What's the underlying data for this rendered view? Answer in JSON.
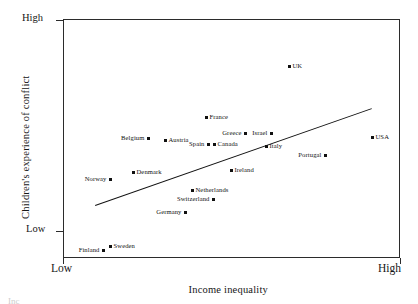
{
  "figure": {
    "background": "#ffffff",
    "ink": "#111111",
    "frame": {
      "left": 63,
      "top": 19,
      "width": 337,
      "height": 239
    }
  },
  "axes": {
    "y": {
      "title": "Children's experience of conflict",
      "high_label": "High",
      "low_label": "Low",
      "high_y": 20,
      "low_y": 231
    },
    "x": {
      "title": "Income inequality",
      "low_label": "Low",
      "high_label": "High"
    }
  },
  "trendline": {
    "x1": 95,
    "y1": 205,
    "x2": 372,
    "y2": 108,
    "color": "#111111"
  },
  "chart_data": {
    "type": "scatter",
    "title": "",
    "xlabel": "Income inequality",
    "ylabel": "Children's experience of conflict",
    "xlim": [
      "Low",
      "High"
    ],
    "ylim": [
      "Low",
      "High"
    ],
    "grid": false,
    "legend": "none",
    "annotations": [
      "trend line: positive slope from lower-left to upper-right"
    ],
    "points": [
      {
        "label": "UK",
        "px": 289,
        "py": 66,
        "label_side": "right"
      },
      {
        "label": "France",
        "px": 206,
        "py": 117,
        "label_side": "right"
      },
      {
        "label": "Greece",
        "px": 245,
        "py": 133,
        "label_side": "left"
      },
      {
        "label": "Israel",
        "px": 271,
        "py": 133,
        "label_side": "left"
      },
      {
        "label": "Belgium",
        "px": 148,
        "py": 138,
        "label_side": "left"
      },
      {
        "label": "Austria",
        "px": 165,
        "py": 140,
        "label_side": "right"
      },
      {
        "label": "Canada",
        "px": 214,
        "py": 144,
        "label_side": "right"
      },
      {
        "label": "Spain",
        "px": 208,
        "py": 144,
        "label_side": "left"
      },
      {
        "label": "Italy",
        "px": 266,
        "py": 146,
        "label_side": "right"
      },
      {
        "label": "USA",
        "px": 372,
        "py": 137,
        "label_side": "right"
      },
      {
        "label": "Portugal",
        "px": 325,
        "py": 155,
        "label_side": "left"
      },
      {
        "label": "Denmark",
        "px": 133,
        "py": 172,
        "label_side": "right"
      },
      {
        "label": "Norway",
        "px": 110,
        "py": 179,
        "label_side": "left"
      },
      {
        "label": "Ireland",
        "px": 231,
        "py": 170,
        "label_side": "right"
      },
      {
        "label": "Netherlands",
        "px": 192,
        "py": 190,
        "label_side": "right"
      },
      {
        "label": "Switzerland",
        "px": 213,
        "py": 199,
        "label_side": "left"
      },
      {
        "label": "Germany",
        "px": 185,
        "py": 212,
        "label_side": "left"
      },
      {
        "label": "Sweden",
        "px": 110,
        "py": 246,
        "label_side": "right"
      },
      {
        "label": "Finland",
        "px": 103,
        "py": 250,
        "label_side": "left"
      }
    ]
  },
  "caption": {
    "partial_text": "Inc"
  }
}
